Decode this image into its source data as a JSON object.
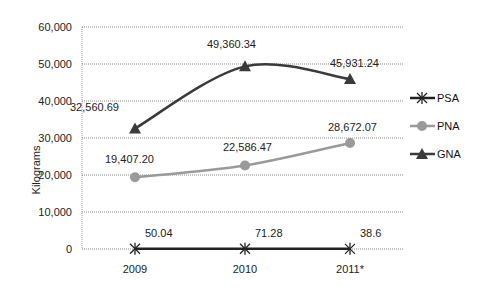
{
  "chart_data": {
    "type": "line",
    "title": "",
    "xlabel": "",
    "ylabel": "Kilograms",
    "ylim": [
      0,
      60000
    ],
    "yticks": [
      "0",
      "10,000",
      "20,000",
      "30,000",
      "40,000",
      "50,000",
      "60,000"
    ],
    "categories": [
      "2009",
      "2010",
      "2011*"
    ],
    "grid": true,
    "legend_position": "right",
    "series": [
      {
        "name": "PSA",
        "marker": "asterisk",
        "color": "#222222",
        "smooth": false,
        "values": [
          50.04,
          71.28,
          38.6
        ],
        "labels": [
          "50.04",
          "71.28",
          "38.6"
        ]
      },
      {
        "name": "PNA",
        "marker": "circle",
        "color": "#9a9a9a",
        "smooth": true,
        "values": [
          19407.2,
          22586.47,
          28672.07
        ],
        "labels": [
          "19,407.20",
          "22,586.47",
          "28,672.07"
        ]
      },
      {
        "name": "GNA",
        "marker": "triangle",
        "color": "#3a3a3a",
        "smooth": true,
        "values": [
          32560.69,
          49360.34,
          45931.24
        ],
        "labels": [
          "32,560.69",
          "49,360.34",
          "45,931.24"
        ]
      }
    ]
  }
}
